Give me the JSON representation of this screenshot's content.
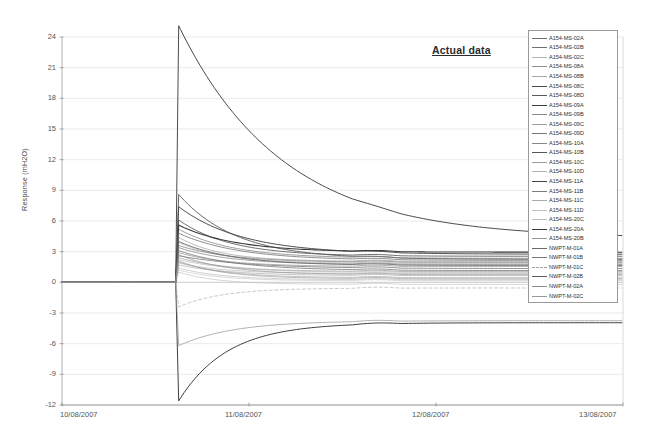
{
  "annotation": {
    "text": "Actual data"
  },
  "axes": {
    "ylabel": "Response (mH2O)",
    "y_ticks": [
      "24",
      "21",
      "18",
      "15",
      "12",
      "9",
      "6",
      "3",
      "0",
      "-3",
      "-6",
      "-9",
      "-12"
    ],
    "x_ticks": [
      "10/08/2007",
      "11/08/2007",
      "12/08/2007",
      "13/08/2007"
    ]
  },
  "chart_data": {
    "type": "line",
    "title": "Actual data",
    "xlabel": "",
    "ylabel": "Response (mH2O)",
    "ylim": [
      -12,
      24
    ],
    "xlim": [
      "10/08/2007",
      "13/08/2007"
    ],
    "y_ticks": [
      24,
      21,
      18,
      15,
      12,
      9,
      6,
      3,
      0,
      -3,
      -6,
      -9,
      -12
    ],
    "x_ticks": [
      "10/08/2007",
      "11/08/2007",
      "12/08/2007",
      "13/08/2007"
    ],
    "grid": true,
    "legend_position": "top-right",
    "x_unit": "days from 10/08/2007",
    "event_time": 0.62,
    "series": [
      {
        "name": "A154-MS-02A",
        "color": "#6e6e6e",
        "width": 0.75,
        "dash": "none",
        "peak": 2.6,
        "plateau": 1.35,
        "decay": 0.34
      },
      {
        "name": "A154-MS-02B",
        "color": "#707070",
        "width": 0.75,
        "dash": "none",
        "peak": 3.1,
        "plateau": 1.15,
        "decay": 0.3
      },
      {
        "name": "A154-MS-02C",
        "color": "#b4b4b4",
        "width": 0.6,
        "dash": "none",
        "peak": 2.2,
        "plateau": 0.95,
        "decay": 0.28
      },
      {
        "name": "A154-MS-08A",
        "color": "#8f8f8f",
        "width": 0.6,
        "dash": "none",
        "peak": 4.4,
        "plateau": 2.05,
        "decay": 0.22
      },
      {
        "name": "A154-MS-08B",
        "color": "#a8a8a8",
        "width": 0.6,
        "dash": "none",
        "peak": 3.9,
        "plateau": 1.85,
        "decay": 0.24
      },
      {
        "name": "A154-MS-08C",
        "color": "#4a4a4a",
        "width": 1.0,
        "dash": "none",
        "peak": 25.1,
        "plateau": 4.3,
        "decay": 0.55
      },
      {
        "name": "A154-MS-08D",
        "color": "#5a5a5a",
        "width": 0.9,
        "dash": "none",
        "peak": 8.6,
        "plateau": 2.25,
        "decay": 0.3
      },
      {
        "name": "A154-MS-09A",
        "color": "#3f3f3f",
        "width": 1.0,
        "dash": "none",
        "peak": -11.6,
        "plateau": -3.95,
        "decay": 0.26
      },
      {
        "name": "A154-MS-09B",
        "color": "#8a8a8a",
        "width": 0.65,
        "dash": "none",
        "peak": -6.2,
        "plateau": -3.75,
        "decay": 0.3
      },
      {
        "name": "A154-MS-09C",
        "color": "#9e9e9e",
        "width": 0.6,
        "dash": "none",
        "peak": 1.7,
        "plateau": 0.65,
        "decay": 0.26
      },
      {
        "name": "A154-MS-09D",
        "color": "#757575",
        "width": 0.7,
        "dash": "none",
        "peak": 5.2,
        "plateau": 2.35,
        "decay": 0.28
      },
      {
        "name": "A154-MS-10A",
        "color": "#888888",
        "width": 0.65,
        "dash": "none",
        "peak": 2.9,
        "plateau": 1.55,
        "decay": 0.25
      },
      {
        "name": "A154-MS-10B",
        "color": "#555555",
        "width": 0.85,
        "dash": "none",
        "peak": 6.1,
        "plateau": 2.55,
        "decay": 0.27
      },
      {
        "name": "A154-MS-10C",
        "color": "#9a9a9a",
        "width": 0.6,
        "dash": "none",
        "peak": 2.0,
        "plateau": 0.45,
        "decay": 0.24
      },
      {
        "name": "A154-MS-10D",
        "color": "#b0b0b0",
        "width": 0.6,
        "dash": "none",
        "peak": 1.4,
        "plateau": 0.25,
        "decay": 0.22
      },
      {
        "name": "A154-MS-11A",
        "color": "#454545",
        "width": 0.95,
        "dash": "none",
        "peak": 7.4,
        "plateau": 2.75,
        "decay": 0.33
      },
      {
        "name": "A154-MS-11B",
        "color": "#7c7c7c",
        "width": 0.7,
        "dash": "none",
        "peak": 3.4,
        "plateau": 1.75,
        "decay": 0.26
      },
      {
        "name": "A154-MS-11C",
        "color": "#ababab",
        "width": 0.6,
        "dash": "none",
        "peak": 1.9,
        "plateau": 0.85,
        "decay": 0.23
      },
      {
        "name": "A154-MS-11D",
        "color": "#c0c0c0",
        "width": 0.6,
        "dash": "none",
        "peak": 1.2,
        "plateau": 0.15,
        "decay": 0.21
      },
      {
        "name": "A154-MS-20C",
        "color": "#bcbcbc",
        "width": 0.6,
        "dash": "none",
        "peak": 1.0,
        "plateau": -0.2,
        "decay": 0.2
      },
      {
        "name": "A154-MS-20A",
        "color": "#3a3a3a",
        "width": 1.05,
        "dash": "none",
        "peak": 5.6,
        "plateau": 2.95,
        "decay": 0.29
      },
      {
        "name": "A154-MS-20B",
        "color": "#969696",
        "width": 0.65,
        "dash": "none",
        "peak": 2.4,
        "plateau": 1.05,
        "decay": 0.25
      },
      {
        "name": "NWPT-M-01A",
        "color": "#6a6a6a",
        "width": 0.75,
        "dash": "none",
        "peak": 4.8,
        "plateau": 2.15,
        "decay": 0.31
      },
      {
        "name": "NWPT-M-01B",
        "color": "#7a7a7a",
        "width": 0.7,
        "dash": "none",
        "peak": 3.6,
        "plateau": 1.95,
        "decay": 0.27
      },
      {
        "name": "NWPT-M-01C",
        "color": "#a2a2a2",
        "width": 0.6,
        "dash": "dashed",
        "peak": -2.4,
        "plateau": -0.55,
        "decay": 0.24
      },
      {
        "name": "NWPT-M-02B",
        "color": "#5f5f5f",
        "width": 0.8,
        "dash": "none",
        "peak": 4.0,
        "plateau": 1.65,
        "decay": 0.28
      },
      {
        "name": "NWPT-M-02A",
        "color": "#8d8d8d",
        "width": 0.65,
        "dash": "none",
        "peak": 2.7,
        "plateau": 0.75,
        "decay": 0.25
      },
      {
        "name": "NWPT-M-02C",
        "color": "#999999",
        "width": 0.65,
        "dash": "none",
        "peak": 2.1,
        "plateau": 0.35,
        "decay": 0.23
      }
    ]
  }
}
